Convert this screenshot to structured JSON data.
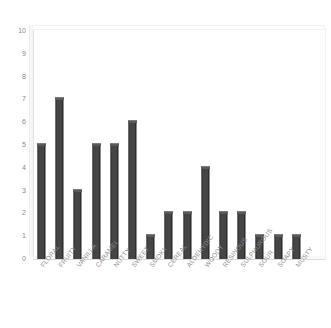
{
  "chart_data": {
    "type": "bar",
    "title": "",
    "subtitle": "",
    "xlabel": "",
    "ylabel": "",
    "ylim": [
      0,
      10
    ],
    "ytick_labels": [
      "10",
      "9",
      "8",
      "7",
      "6",
      "5",
      "4",
      "3",
      "2",
      "1",
      "0"
    ],
    "ytick_values": [
      10,
      9,
      8,
      7,
      6,
      5,
      4,
      3,
      2,
      1,
      0
    ],
    "grid": false,
    "legend": false,
    "legend_position": "none",
    "bar_color": "#454545",
    "categories": [
      "FLORAL",
      "FRUITY",
      "VANILLA",
      "CARAMEL",
      "NUTTY",
      "SWEET",
      "SMOKY",
      "CEREAL",
      "ALDEHYDIC",
      "WOODY",
      "RESINOUS",
      "SULPHUROUS",
      "SOUR",
      "SOAPY",
      "MUSTY"
    ],
    "values": [
      5,
      7,
      3,
      5,
      5,
      6,
      1,
      2,
      2,
      4,
      2,
      2,
      1,
      1,
      1
    ]
  }
}
